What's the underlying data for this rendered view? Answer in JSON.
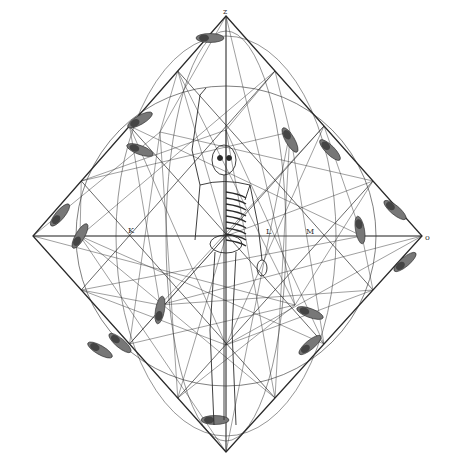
{
  "figure": {
    "ink_color": "#2a2a2a",
    "paper_color": "#ffffff",
    "diamond": {
      "top": [
        226,
        16
      ],
      "right": [
        422,
        236
      ],
      "bottom": [
        226,
        452
      ],
      "left": [
        33,
        236
      ]
    },
    "center": [
      226,
      236
    ],
    "hubs": [
      [
        226,
        236
      ],
      [
        80,
        236
      ],
      [
        362,
        236
      ],
      [
        160,
        132
      ],
      [
        290,
        132
      ],
      [
        160,
        305
      ],
      [
        295,
        305
      ],
      [
        226,
        130
      ],
      [
        226,
        345
      ]
    ],
    "labels": [
      {
        "text": "z",
        "x": 223,
        "y": 14
      },
      {
        "text": "o",
        "x": 425,
        "y": 240
      },
      {
        "text": "K",
        "x": 128,
        "y": 233
      },
      {
        "text": "L",
        "x": 266,
        "y": 234
      },
      {
        "text": "M",
        "x": 306,
        "y": 234
      }
    ],
    "footprints": [
      {
        "x": 210,
        "y": 38,
        "angle": 0
      },
      {
        "x": 140,
        "y": 120,
        "angle": -30
      },
      {
        "x": 140,
        "y": 150,
        "angle": 20
      },
      {
        "x": 80,
        "y": 236,
        "angle": -60
      },
      {
        "x": 60,
        "y": 215,
        "angle": -50
      },
      {
        "x": 290,
        "y": 140,
        "angle": 60
      },
      {
        "x": 330,
        "y": 150,
        "angle": 45
      },
      {
        "x": 360,
        "y": 230,
        "angle": 80
      },
      {
        "x": 395,
        "y": 210,
        "angle": 40
      },
      {
        "x": 160,
        "y": 310,
        "angle": -80
      },
      {
        "x": 310,
        "y": 313,
        "angle": 20
      },
      {
        "x": 310,
        "y": 345,
        "angle": -40
      },
      {
        "x": 120,
        "y": 343,
        "angle": 40
      },
      {
        "x": 215,
        "y": 420,
        "angle": 0
      },
      {
        "x": 100,
        "y": 350,
        "angle": 30
      },
      {
        "x": 405,
        "y": 262,
        "angle": -40
      }
    ]
  }
}
